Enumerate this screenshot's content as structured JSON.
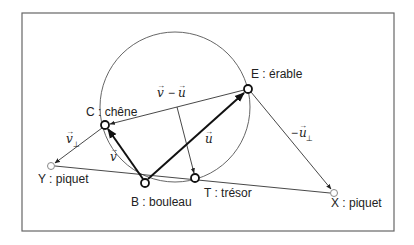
{
  "diagram": {
    "type": "geometry-treasure-map",
    "frame": {
      "x": 22,
      "y": 13,
      "width": 372,
      "height": 218,
      "stroke": "#666666"
    },
    "circle": {
      "cx": 175,
      "cy": 107,
      "r": 75,
      "stroke": "#555555"
    },
    "points": [
      {
        "id": "C",
        "label": "C : chêne",
        "x": 105,
        "y": 125,
        "style": "bold"
      },
      {
        "id": "E",
        "label": "E : érable",
        "x": 248,
        "y": 89,
        "style": "bold"
      },
      {
        "id": "B",
        "label": "B : bouleau",
        "x": 145,
        "y": 183,
        "style": "bold"
      },
      {
        "id": "T",
        "label": "T : trésor",
        "x": 195,
        "y": 178,
        "style": "bold"
      },
      {
        "id": "Y",
        "label": "Y : piquet",
        "x": 51,
        "y": 166,
        "style": "light"
      },
      {
        "id": "X",
        "label": "X : piquet",
        "x": 334,
        "y": 193,
        "style": "light"
      }
    ],
    "vectors": [
      {
        "name": "v",
        "label": "v",
        "from": "B",
        "to": "C",
        "bold": true
      },
      {
        "name": "u",
        "label": "u",
        "from": "B",
        "to": "E",
        "bold": true
      },
      {
        "name": "v-u",
        "label": "v − u",
        "from": "E",
        "to": "C",
        "bold": false
      },
      {
        "name": "v_perp",
        "label": "v",
        "subscript": "⊥",
        "from": "C",
        "to": "Y",
        "bold": false
      },
      {
        "name": "-u_perp",
        "label": "− u",
        "subscript": "⊥",
        "from": "E",
        "to": "X",
        "bold": false
      },
      {
        "name": "mid-to-T",
        "label": "",
        "from": "M",
        "to": "T",
        "bold": false
      }
    ],
    "segments": [
      {
        "from": "Y",
        "to": "X"
      }
    ],
    "labels": {
      "C": "C : chêne",
      "E": "E : érable",
      "B": "B : bouleau",
      "T": "T : trésor",
      "Y": "Y : piquet",
      "X": "X : piquet",
      "v_minus_u_v": "v",
      "v_minus_u_minus": "−",
      "v_minus_u_u": "u",
      "u": "u",
      "v": "v",
      "v_perp": "v",
      "perp": "⊥",
      "neg_u_perp_minus": "−",
      "neg_u_perp_u": "u"
    }
  }
}
